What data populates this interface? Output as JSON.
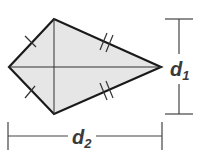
{
  "figure": {
    "shape": "kite",
    "fill_color": "#e6e6e6",
    "stroke_color": "#1a1a1a",
    "vertices": {
      "left": [
        9,
        67
      ],
      "top": [
        54,
        19
      ],
      "right": [
        161,
        67
      ],
      "bottom": [
        54,
        114
      ]
    },
    "diagonals": [
      "vertical top-bottom",
      "horizontal left-right"
    ],
    "congruence_marks": {
      "short_sides": "single tick",
      "long_sides": "double tick"
    }
  },
  "labels": {
    "d1": {
      "base": "d",
      "sub": "1"
    },
    "d2": {
      "base": "d",
      "sub": "2"
    }
  },
  "dimensions": {
    "d1": {
      "orientation": "vertical",
      "x": 179,
      "from_y": 19,
      "to_y": 114
    },
    "d2": {
      "orientation": "horizontal",
      "y": 136,
      "from_x": 8,
      "to_x": 162
    }
  }
}
